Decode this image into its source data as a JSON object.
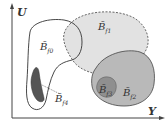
{
  "axes": {
    "x_label": "Y",
    "y_label": "U"
  },
  "sets": [
    {
      "id": "f0",
      "label": "B̃",
      "sub": "f0",
      "style": "outline"
    },
    {
      "id": "f1",
      "label": "B̃",
      "sub": "f1",
      "style": "light-dashed"
    },
    {
      "id": "f2",
      "label": "B̃",
      "sub": "f2",
      "style": "medium-gray"
    },
    {
      "id": "f3",
      "label": "B̃",
      "sub": "f3",
      "style": "dark-gray"
    },
    {
      "id": "f4",
      "label": "B̃",
      "sub": "f4",
      "style": "darkest"
    }
  ],
  "colors": {
    "f1": "#e2e2e2",
    "f2": "#b9b9b9",
    "f3": "#8f8f8f",
    "f4": "#555555",
    "stroke": "#333333"
  }
}
